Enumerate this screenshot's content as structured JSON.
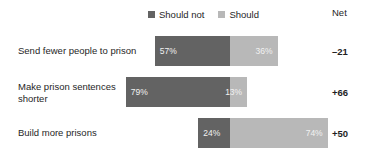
{
  "chart_data": {
    "type": "bar",
    "subtype": "diverging-stacked-bar",
    "title": "",
    "xlabel": "",
    "ylabel": "",
    "categories": [
      "Send fewer people to prison",
      "Make prison sentences shorter",
      "Build more prisons"
    ],
    "series": [
      {
        "name": "Should not",
        "color": "#636363",
        "values": [
          57,
          79,
          24
        ]
      },
      {
        "name": "Should",
        "color": "#b8b8b8",
        "values": [
          36,
          13,
          74
        ]
      }
    ],
    "net_label": "Net",
    "net": [
      "–21",
      "+66",
      "+50"
    ],
    "value_labels": [
      [
        "57%",
        "36%"
      ],
      [
        "79%",
        "13%"
      ],
      [
        "24%",
        "74%"
      ]
    ],
    "legend": {
      "position": "top-center",
      "entries": [
        {
          "label": "Should not",
          "color": "#636363"
        },
        {
          "label": "Should",
          "color": "#b8b8b8"
        }
      ]
    },
    "grid": false,
    "axis": {
      "zero_line_x_px": 230,
      "px_per_percent": 1.32
    }
  }
}
